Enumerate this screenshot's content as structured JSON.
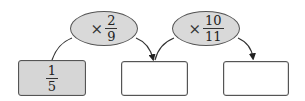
{
  "diagram": {
    "type": "multiplication-chain",
    "operators": [
      {
        "symbol": "×",
        "numerator": "2",
        "denominator": "9"
      },
      {
        "symbol": "×",
        "numerator": "10",
        "denominator": "11"
      }
    ],
    "boxes": [
      {
        "numerator": "1",
        "denominator": "5",
        "filled": true
      },
      {
        "value": "",
        "filled": false
      },
      {
        "value": "",
        "filled": false
      }
    ],
    "colors": {
      "box_fill": "#d6d6d6",
      "ellipse_fill": "#d9d9d9",
      "stroke": "#555555"
    }
  }
}
